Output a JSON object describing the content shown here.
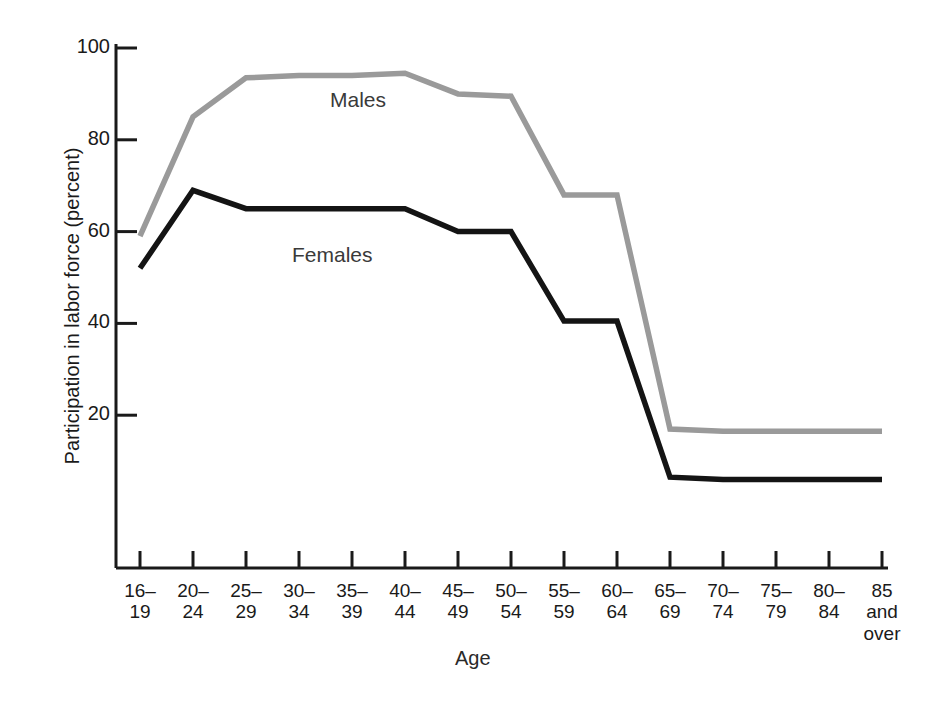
{
  "chart_data": {
    "type": "line",
    "title": "",
    "xlabel": "Age",
    "ylabel": "Participation in labor force (percent)",
    "categories": [
      "16–19",
      "20–24",
      "25–29",
      "30–34",
      "35–39",
      "40–44",
      "45–49",
      "50–54",
      "55–59",
      "60–64",
      "65–69",
      "70–74",
      "75–79",
      "80–84",
      "85 and over"
    ],
    "category_lines": [
      [
        "16–",
        "19"
      ],
      [
        "20–",
        "24"
      ],
      [
        "25–",
        "29"
      ],
      [
        "30–",
        "34"
      ],
      [
        "35–",
        "39"
      ],
      [
        "40–",
        "44"
      ],
      [
        "45–",
        "49"
      ],
      [
        "50–",
        "54"
      ],
      [
        "55–",
        "59"
      ],
      [
        "60–",
        "64"
      ],
      [
        "65–",
        "69"
      ],
      [
        "70–",
        "74"
      ],
      [
        "75–",
        "79"
      ],
      [
        "80–",
        "84"
      ],
      [
        "85",
        "and",
        "over"
      ]
    ],
    "series": [
      {
        "name": "Males",
        "color": "#9a9a9a",
        "values": [
          59,
          85,
          93.5,
          94,
          94,
          94.5,
          90,
          89.5,
          68,
          68,
          17,
          16.5,
          16.5,
          16.5,
          16.5
        ]
      },
      {
        "name": "Females",
        "color": "#141414",
        "values": [
          52,
          69,
          65,
          65,
          65,
          65,
          60,
          60,
          40.5,
          40.5,
          6.5,
          6,
          6,
          6,
          6
        ]
      }
    ],
    "ylim": [
      0,
      100
    ],
    "ytick_values": [
      20,
      40,
      60,
      80,
      100
    ],
    "ytick_labels": [
      "20",
      "40",
      "60",
      "80",
      "100"
    ],
    "grid": false,
    "legend_position": "inline-annotations",
    "annotations": [
      {
        "text": "Males",
        "series": "Males"
      },
      {
        "text": "Females",
        "series": "Females"
      }
    ]
  },
  "axes": {
    "y_title": "Participation in labor force (percent)",
    "x_title": "Age"
  }
}
